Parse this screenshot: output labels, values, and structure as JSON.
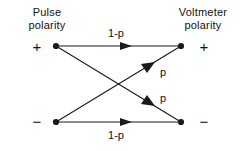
{
  "diagram": {
    "stroke_color": "#1a1a1a",
    "text_color": "#111111",
    "background_color": "#ffffff",
    "left_header": {
      "line1": "Pulse",
      "line2": "polarity"
    },
    "right_header": {
      "line1": "Voltmeter",
      "line2": "polarity"
    },
    "signs": {
      "pulse_plus": "+",
      "pulse_minus": "−",
      "voltmeter_plus": "+",
      "voltmeter_minus": "−"
    },
    "nodes": [
      {
        "id": "pulse-plus",
        "label": "+",
        "x": 56,
        "y": 46,
        "side": "left"
      },
      {
        "id": "pulse-minus",
        "label": "−",
        "x": 56,
        "y": 122,
        "side": "left"
      },
      {
        "id": "voltmeter-plus",
        "label": "+",
        "x": 181,
        "y": 46,
        "side": "right"
      },
      {
        "id": "voltmeter-minus",
        "label": "−",
        "x": 181,
        "y": 122,
        "side": "right"
      }
    ],
    "edges": [
      {
        "id": "plus-to-plus",
        "from": "pulse-plus",
        "to": "voltmeter-plus",
        "label": "1-p",
        "kind": "horizontal"
      },
      {
        "id": "minus-to-minus",
        "from": "pulse-minus",
        "to": "voltmeter-minus",
        "label": "1-p",
        "kind": "horizontal"
      },
      {
        "id": "minus-to-plus",
        "from": "pulse-minus",
        "to": "voltmeter-plus",
        "label": "p",
        "kind": "diagonal-up"
      },
      {
        "id": "plus-to-minus",
        "from": "pulse-plus",
        "to": "voltmeter-minus",
        "label": "p",
        "kind": "diagonal-down"
      }
    ],
    "labels": {
      "top_edge": "1-p",
      "bottom_edge": "1-p",
      "upper_diagonal": "p",
      "lower_diagonal": "p"
    }
  }
}
